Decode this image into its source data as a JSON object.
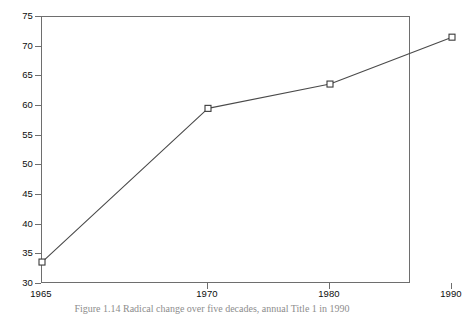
{
  "chart_data": {
    "type": "line",
    "title": "",
    "subtitle": "",
    "xlabel": "",
    "ylabel": "",
    "x": [
      1965,
      1970,
      1980,
      1990
    ],
    "categories": [
      "1965",
      "1970",
      "1980",
      "1990"
    ],
    "values": [
      33.7,
      59.6,
      63.7,
      71.6
    ],
    "series": [
      {
        "name": "series-1",
        "values": [
          33.7,
          59.6,
          63.7,
          71.6
        ],
        "marker": "open-square",
        "line_color": "#4a4a4a",
        "marker_color": "#3a3a3a"
      }
    ],
    "xlim": [
      1965,
      1990
    ],
    "ylim": [
      30,
      75
    ],
    "x_tick_labels": [
      "1965",
      "1970",
      "1980",
      "1990"
    ],
    "x_tick_positions": [
      0,
      166,
      288,
      410
    ],
    "y_tick_labels": [
      "30",
      "35",
      "40",
      "45",
      "50",
      "55",
      "60",
      "65",
      "70",
      "75"
    ],
    "y_ticks": [
      30,
      35,
      40,
      45,
      50,
      55,
      60,
      65,
      70,
      75
    ],
    "grid": false,
    "legend": null,
    "legend_position": "none",
    "annotations": []
  },
  "figure": {
    "caption": "Figure 1.14   Radical change over five decades, annual Title 1 in 1990",
    "background_color": "#ffffff",
    "frame_color": "#6e6e6e",
    "text_color": "#0d0d0d"
  }
}
